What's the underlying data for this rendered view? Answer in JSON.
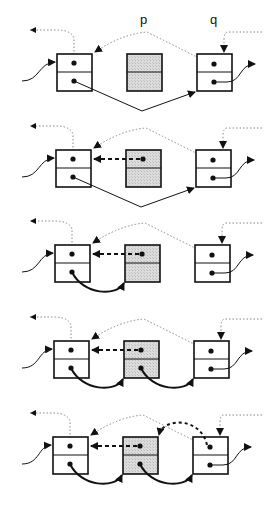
{
  "labels": {
    "p": "p",
    "q": "q"
  },
  "colors": {
    "stroke": "#111111",
    "node_fill": "#ffffff",
    "new_node_fill": "#d4d4d4",
    "dotted": "#888888"
  },
  "steps": [
    {
      "index": 1,
      "box_y": 54,
      "x_offset": 0,
      "new_prev_link": false,
      "new_from_left": false,
      "new_to_right": false,
      "right_back_to_new": false
    },
    {
      "index": 2,
      "box_y": 150,
      "x_offset": -1,
      "new_prev_link": true,
      "new_from_left": false,
      "new_to_right": false,
      "right_back_to_new": false
    },
    {
      "index": 3,
      "box_y": 245,
      "x_offset": -2,
      "new_prev_link": true,
      "new_from_left": true,
      "new_to_right": false,
      "right_back_to_new": false
    },
    {
      "index": 4,
      "box_y": 341,
      "x_offset": -3,
      "new_prev_link": true,
      "new_from_left": true,
      "new_to_right": true,
      "right_back_to_new": false
    },
    {
      "index": 5,
      "box_y": 437,
      "x_offset": -4,
      "new_prev_link": true,
      "new_from_left": true,
      "new_to_right": true,
      "right_back_to_new": true
    }
  ]
}
